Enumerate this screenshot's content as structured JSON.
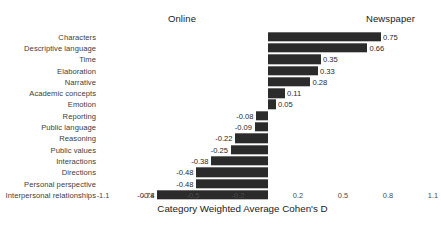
{
  "chart_data": {
    "type": "bar",
    "orientation": "horizontal",
    "title": "",
    "xlabel": "Category Weighted Average Cohen's D",
    "ylabel": "",
    "xlim": [
      -1.1,
      1.1
    ],
    "xticks": [
      -1.1,
      -0.8,
      -0.5,
      -0.2,
      0.2,
      0.5,
      0.8,
      1.1
    ],
    "xticklabels": [
      "-1.1",
      "-0.8",
      "-0.5",
      "-0.2",
      "0.2",
      "0.5",
      "0.8",
      "1.1"
    ],
    "grid": false,
    "legend": "none",
    "bar_color": "#2b2b2b",
    "annotations": [
      {
        "text": "Online",
        "side": "left"
      },
      {
        "text": "Newspaper",
        "side": "right"
      }
    ],
    "categories": [
      "Characters",
      "Descriptive language",
      "Time",
      "Elaboration",
      "Narrative",
      "Academic concepts",
      "Emotion",
      "Reporting",
      "Public language",
      "Reasoning",
      "Public values",
      "Interactions",
      "Directions",
      "Personal perspective",
      "Interpersonal relationships"
    ],
    "values": [
      0.75,
      0.66,
      0.35,
      0.33,
      0.28,
      0.11,
      0.05,
      -0.08,
      -0.09,
      -0.22,
      -0.25,
      -0.38,
      -0.48,
      -0.48,
      -0.74
    ],
    "value_labels": [
      "0.75",
      "0.66",
      "0.35",
      "0.33",
      "0.28",
      "0.11",
      "0.05",
      "-0.08",
      "-0.09",
      "-0.22",
      "-0.25",
      "-0.38",
      "-0.48",
      "-0.48",
      "-0.74"
    ]
  },
  "header": {
    "left_group": "Online",
    "right_group": "Newspaper"
  },
  "axis": {
    "title": "Category Weighted Average Cohen's D"
  }
}
